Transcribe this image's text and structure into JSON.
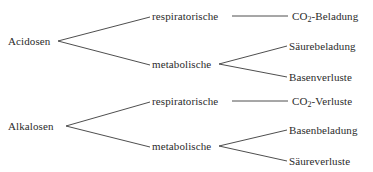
{
  "diagram": {
    "type": "tree",
    "orientation": "left-to-right",
    "language": "de",
    "background_color": "#ffffff",
    "line_color": "#3a3a3a",
    "text_color": "#2b2b2b",
    "roots": [
      {
        "id": "acidosen",
        "label": "Acidosen",
        "x": 8,
        "y": 41,
        "fork_x": 58,
        "children": [
          {
            "id": "acidosen-respiratorische",
            "label": "respiratorische",
            "x": 152,
            "y": 16,
            "connector": "straight",
            "line_start_x": 232,
            "line_end_x": 288,
            "children": [
              {
                "id": "acidosen-resp-co2-beladung",
                "label_pre": "CO",
                "label_sub": "2",
                "label_post": "-Beladung",
                "label": "CO2-Beladung",
                "x": 292,
                "y": 16
              }
            ]
          },
          {
            "id": "acidosen-metabolische",
            "label": "metabolische",
            "x": 152,
            "y": 64,
            "connector": "fork",
            "fork_x": 219,
            "children": [
              {
                "id": "acidosen-met-saeurebeladung",
                "label": "Säurebeladung",
                "x": 289,
                "y": 46
              },
              {
                "id": "acidosen-met-basenverluste",
                "label": "Basenverluste",
                "x": 289,
                "y": 77
              }
            ]
          }
        ]
      },
      {
        "id": "alkalosen",
        "label": "Alkalosen",
        "x": 8,
        "y": 126,
        "fork_x": 66,
        "children": [
          {
            "id": "alkalosen-respiratorische",
            "label": "respiratorische",
            "x": 152,
            "y": 101,
            "connector": "straight",
            "line_start_x": 232,
            "line_end_x": 288,
            "children": [
              {
                "id": "alkalosen-resp-co2-verluste",
                "label_pre": "CO",
                "label_sub": "2",
                "label_post": "-Verluste",
                "label": "CO2-Verluste",
                "x": 292,
                "y": 101
              }
            ]
          },
          {
            "id": "alkalosen-metabolische",
            "label": "metabolische",
            "x": 152,
            "y": 146,
            "connector": "fork",
            "fork_x": 219,
            "children": [
              {
                "id": "alkalosen-met-basenbeladung",
                "label": "Basenbeladung",
                "x": 289,
                "y": 130
              },
              {
                "id": "alkalosen-met-saeureverluste",
                "label": "Säureverluste",
                "x": 289,
                "y": 161
              }
            ]
          }
        ]
      }
    ]
  }
}
